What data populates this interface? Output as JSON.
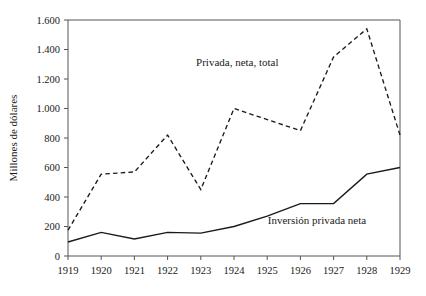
{
  "chart_data": {
    "type": "line",
    "title": "",
    "xlabel": "",
    "ylabel": "Millones de dólares",
    "x": [
      1919,
      1920,
      1921,
      1922,
      1923,
      1924,
      1925,
      1926,
      1927,
      1928,
      1929
    ],
    "xtick_labels": [
      "1919",
      "1920",
      "1921",
      "1922",
      "1923",
      "1924",
      "1925",
      "1926",
      "1927",
      "1928",
      "1929"
    ],
    "ytick_labels": [
      "0",
      "200",
      "400",
      "600",
      "800",
      "1.000",
      "1.200",
      "1.400",
      "1.600"
    ],
    "ytick_values": [
      0,
      200,
      400,
      600,
      800,
      1000,
      1200,
      1400,
      1600
    ],
    "ylim": [
      0,
      1600
    ],
    "xlim": [
      1919,
      1929
    ],
    "grid": false,
    "legend_position": "inline-annotation",
    "series": [
      {
        "name": "Privada, neta, total",
        "style": "dashed",
        "color": "#1a1a1a",
        "values": [
          175,
          555,
          570,
          820,
          450,
          1000,
          925,
          850,
          1350,
          1540,
          820
        ],
        "label_text": "Privada, neta, total",
        "label_x": 1924.1,
        "label_y": 1290
      },
      {
        "name": "Inversión privada neta",
        "style": "solid",
        "color": "#1a1a1a",
        "values": [
          95,
          160,
          115,
          160,
          155,
          200,
          270,
          355,
          355,
          555,
          600
        ],
        "label_text": "Inversión privada neta",
        "label_x": 1926.5,
        "label_y": 215
      }
    ]
  },
  "axes": {
    "y_title": "Millones de dólares"
  }
}
